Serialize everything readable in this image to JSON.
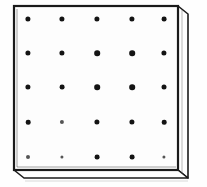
{
  "figure": {
    "title": "Perforated plate with dot grid",
    "description": "Line drawing of a rectangular slab shown in slight perspective, with a regular grid of round holes on its top face.",
    "background_color": "#fefefe",
    "ink_color": "#141414"
  },
  "plate": {
    "name": "perforated-plate",
    "face_color": "#fdfdfd",
    "edge_color": "#1a1a1a",
    "side_color": "#fbfbfb",
    "outline_width_px": 2,
    "face": {
      "x": 14,
      "y": 6,
      "width": 164,
      "height": 164
    },
    "side_panel": {
      "width": 10,
      "label": "right-side-face"
    },
    "bottom_bevel": {
      "height": 9,
      "label": "bottom-bevel-face"
    }
  },
  "chart_data": {
    "type": "scatter",
    "xlabel": "",
    "ylabel": "",
    "grid": false,
    "legend_position": "none",
    "rows": 5,
    "columns": 5,
    "dot_count": 25,
    "dot_diameter_px": 5,
    "x": [
      28,
      62,
      97,
      132,
      164
    ],
    "y": [
      19,
      53,
      87,
      122,
      157
    ],
    "points": [
      {
        "x": 28,
        "y": 19,
        "r": 2.6,
        "faint": false
      },
      {
        "x": 62,
        "y": 19,
        "r": 2.6,
        "faint": false
      },
      {
        "x": 97,
        "y": 19,
        "r": 2.6,
        "faint": false
      },
      {
        "x": 132,
        "y": 19,
        "r": 2.6,
        "faint": false
      },
      {
        "x": 164,
        "y": 19,
        "r": 2.4,
        "faint": false
      },
      {
        "x": 28,
        "y": 53,
        "r": 2.6,
        "faint": false
      },
      {
        "x": 62,
        "y": 53,
        "r": 2.6,
        "faint": false
      },
      {
        "x": 97,
        "y": 53,
        "r": 2.8,
        "faint": false
      },
      {
        "x": 132,
        "y": 53,
        "r": 2.8,
        "faint": false
      },
      {
        "x": 164,
        "y": 53,
        "r": 2.6,
        "faint": false
      },
      {
        "x": 28,
        "y": 87,
        "r": 2.6,
        "faint": false
      },
      {
        "x": 62,
        "y": 87,
        "r": 2.4,
        "faint": false
      },
      {
        "x": 97,
        "y": 87,
        "r": 2.8,
        "faint": false
      },
      {
        "x": 132,
        "y": 87,
        "r": 2.8,
        "faint": false
      },
      {
        "x": 164,
        "y": 87,
        "r": 2.5,
        "faint": false
      },
      {
        "x": 28,
        "y": 122,
        "r": 2.3,
        "faint": false
      },
      {
        "x": 62,
        "y": 122,
        "r": 2.1,
        "faint": true
      },
      {
        "x": 97,
        "y": 122,
        "r": 2.6,
        "faint": false
      },
      {
        "x": 132,
        "y": 122,
        "r": 2.6,
        "faint": false
      },
      {
        "x": 164,
        "y": 122,
        "r": 2.3,
        "faint": false
      },
      {
        "x": 28,
        "y": 157,
        "r": 2.0,
        "faint": true
      },
      {
        "x": 62,
        "y": 157,
        "r": 1.6,
        "faint": true
      },
      {
        "x": 97,
        "y": 157,
        "r": 2.4,
        "faint": false
      },
      {
        "x": 132,
        "y": 157,
        "r": 2.4,
        "faint": false
      },
      {
        "x": 164,
        "y": 157,
        "r": 1.6,
        "faint": true
      }
    ]
  }
}
